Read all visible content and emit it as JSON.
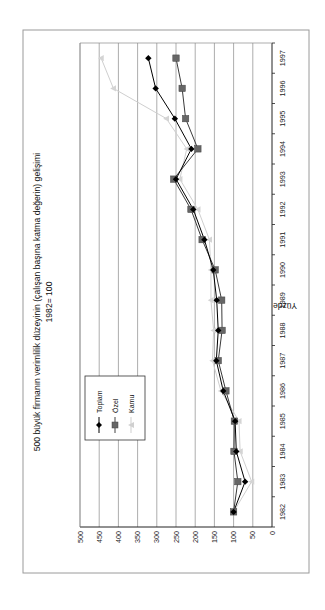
{
  "chart_data": {
    "type": "line",
    "title": "500 büyük firmanın verimlilik düzeyinin (çalışan başına katma değerin) gelişimi",
    "subtitle": "1982= 100",
    "xlabel": "",
    "ylabel": "Yüzde",
    "ylim": [
      0,
      500
    ],
    "yticks": [
      0,
      50,
      100,
      150,
      200,
      250,
      300,
      350,
      400,
      450,
      500
    ],
    "grid": true,
    "legend_position": "upper-left (inside plot)",
    "orientation": "rotated 90° counter-clockwise on page",
    "categories": [
      "1982",
      "1983",
      "1984",
      "1985",
      "1986",
      "1987",
      "1988",
      "1989",
      "1990",
      "1991",
      "1992",
      "1993",
      "1994",
      "1995",
      "1996",
      "1997"
    ],
    "series": [
      {
        "name": "Toplam",
        "marker": "diamond",
        "color": "#000000",
        "values": [
          100,
          70,
          93,
          96,
          127,
          145,
          140,
          144,
          153,
          176,
          205,
          250,
          210,
          253,
          303,
          322
        ]
      },
      {
        "name": "Özel",
        "marker": "square",
        "color": "#555555",
        "values": [
          100,
          89,
          99,
          98,
          120,
          140,
          130,
          131,
          148,
          182,
          211,
          256,
          193,
          225,
          234,
          250
        ]
      },
      {
        "name": "Kamu",
        "marker": "triangle",
        "color": "#c8c8c8",
        "values": [
          100,
          53,
          83,
          86,
          133,
          155,
          152,
          159,
          159,
          163,
          193,
          240,
          222,
          275,
          413,
          445
        ]
      }
    ]
  },
  "legend": {
    "items": [
      {
        "label": "Toplam"
      },
      {
        "label": "Özel"
      },
      {
        "label": "Kamu"
      }
    ]
  }
}
